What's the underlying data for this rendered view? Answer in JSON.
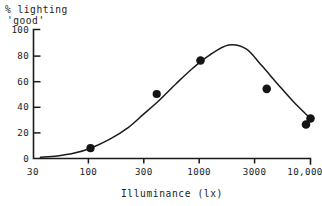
{
  "chart_data": {
    "type": "line",
    "title": "",
    "subtitle": "",
    "ylabel_lines": [
      "% lighting",
      "'good'"
    ],
    "ylabel": "% lighting 'good'",
    "xlabel": "Illuminance (lx)",
    "xscale": "log",
    "yscale": "linear",
    "grid": false,
    "legend": "none",
    "xlim": [
      30,
      10000
    ],
    "ylim": [
      0,
      100
    ],
    "yticks": [
      0,
      20,
      40,
      60,
      80,
      100
    ],
    "ytick_labels": [
      "0",
      "20",
      "40",
      "60",
      "80",
      "100"
    ],
    "xticks": [
      30,
      100,
      300,
      1000,
      3000,
      10000
    ],
    "xtick_labels": [
      "30",
      "100",
      "300",
      "1000",
      "3000",
      "10,000"
    ],
    "series": [
      {
        "name": "% lighting 'good'",
        "marker": "filled-circle",
        "line": "smooth-fitted-curve",
        "x": [
          50,
          100,
          400,
          1000,
          4000,
          10000
        ],
        "values": [
          2,
          8,
          50,
          76,
          54,
          31
        ]
      }
    ],
    "fitted_curve": {
      "description": "smooth unimodal curve peaking near 1800 lx",
      "peak_x": 1800,
      "peak_value": 88,
      "x": [
        35,
        50,
        70,
        100,
        150,
        220,
        300,
        420,
        600,
        850,
        1200,
        1800,
        2600,
        3600,
        5000,
        7000,
        10000
      ],
      "values": [
        1,
        2,
        4,
        8,
        15,
        24,
        34,
        45,
        58,
        70,
        80,
        88,
        85,
        72,
        58,
        44,
        31
      ]
    }
  }
}
